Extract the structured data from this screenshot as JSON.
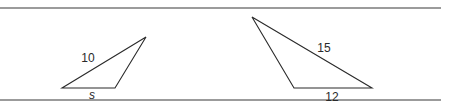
{
  "figure": {
    "left_triangle": {
      "vertices": [
        [
          62,
          88
        ],
        [
          115,
          88
        ],
        [
          146,
          37
        ]
      ],
      "labels": {
        "hypotenuse": "10",
        "base": "s"
      }
    },
    "right_triangle": {
      "vertices": [
        [
          252,
          17
        ],
        [
          294,
          88
        ],
        [
          372,
          88
        ]
      ],
      "labels": {
        "long_side": "15",
        "base": "12"
      }
    },
    "colors": {
      "rule": "#7a7a7a",
      "stroke": "#2a2a2a",
      "background": "#ffffff"
    }
  }
}
